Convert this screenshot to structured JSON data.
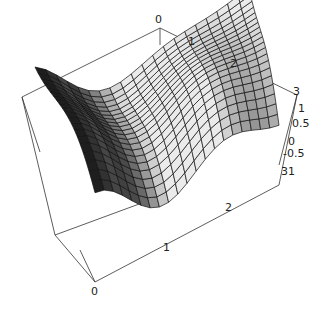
{
  "chart_data": {
    "type": "surface3d",
    "title": "",
    "xlabel": "",
    "ylabel": "",
    "zlabel": "",
    "x_ticks": [
      "0",
      "1",
      "2"
    ],
    "y_ticks": [
      "0",
      "1",
      "2",
      "3"
    ],
    "z_ticks": [
      "3",
      "1",
      "0.5",
      "0",
      "-0.5",
      "31"
    ],
    "xlim": [
      0,
      3
    ],
    "ylim": [
      0,
      3
    ],
    "zlim": [
      -1,
      1
    ],
    "grid": false,
    "box": true,
    "mesh": "20x20 quadrilateral mesh, grayscale shaded"
  },
  "labels": {
    "back_top_zero": "0",
    "back_top_one": "1",
    "back_top_two": "2",
    "z_three": "3",
    "z_one": "1",
    "z_half": "0.5",
    "z_zero": "0",
    "z_neg_half": "-0.5",
    "z_bottom": "31",
    "front_zero": "0",
    "front_one": "1",
    "front_two": "2"
  }
}
